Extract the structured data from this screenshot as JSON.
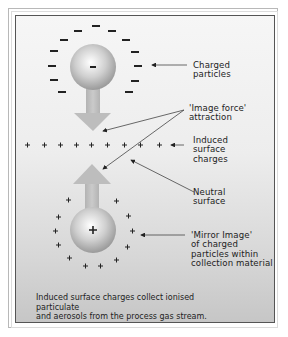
{
  "figure": {
    "labels": {
      "charged_particles": [
        "Charged",
        "particles"
      ],
      "image_force": [
        "'Image force'",
        "attraction"
      ],
      "induced_surface": [
        "Induced",
        "surface",
        "charges"
      ],
      "neutral_surface": [
        "Neutral",
        "surface"
      ],
      "mirror_image": [
        "'Mirror Image'",
        "of charged",
        "particles within",
        "collection material"
      ]
    },
    "top_sphere_sign": "−",
    "bottom_sphere_sign": "+",
    "caption": [
      "Induced surface charges collect ionised particulate",
      "and aerosols from the process gas stream."
    ],
    "colors": {
      "sphere": "#b5b5b5",
      "arrow": "#bdbdbd",
      "line": "#444444",
      "text": "#222222"
    }
  }
}
